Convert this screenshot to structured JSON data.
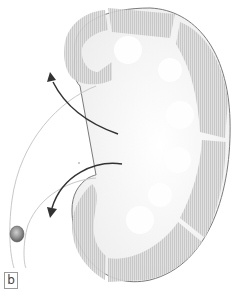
{
  "figure": {
    "panel_label": "b"
  },
  "colors": {
    "cortex_fill": "#d9d9d9",
    "cortex_stripes": "#bdbdbd",
    "outline": "#7a7a7a",
    "arrow": "#333333",
    "ureter_line": "#c8c8c8",
    "stone": "#8a8a8a",
    "pelvis_fill": "#f3f3f3"
  },
  "elements": {
    "upper_arrow": "arrow-out-of-kidney",
    "lower_arrow": "arrow-down-ureter",
    "stone": "kidney-stone"
  }
}
